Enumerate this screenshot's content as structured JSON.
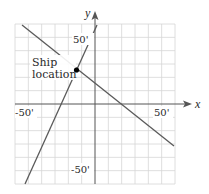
{
  "diagram": {
    "axes": {
      "x_label": "x",
      "y_label": "y",
      "tick_labels": {
        "x_neg": "-50'",
        "x_pos": "50'",
        "y_pos": "50'",
        "y_neg": "-50'"
      }
    },
    "grid": {
      "cells_x": 12,
      "cells_y": 12,
      "unit_ft": 10,
      "range": [
        -60,
        60
      ]
    },
    "point": {
      "label_line1": "Ship",
      "label_line2": "location",
      "x_ft": -14,
      "y_ft": 26
    },
    "lines": [
      {
        "name": "descending-line",
        "from_ft": [
          -55,
          60
        ],
        "to_ft": [
          60,
          -32
        ]
      },
      {
        "name": "steep-line",
        "from_ft": [
          -53,
          -60
        ],
        "to_ft": [
          2,
          60
        ]
      }
    ],
    "colors": {
      "grid": "#d6d6d6",
      "axis": "#555555",
      "line": "#5a5a5a",
      "point": "#000000",
      "text": "#2a2a2a"
    }
  }
}
